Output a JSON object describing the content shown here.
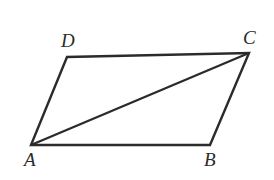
{
  "figure": {
    "kind": "geometry-diagram",
    "shape": "parallelogram-with-diagonal",
    "background_color": "#ffffff",
    "stroke_color": "#2b2b2b",
    "stroke_width": 2.4,
    "label_color": "#2b2b2b",
    "vertices": [
      {
        "name": "A",
        "label": "A",
        "x": 31,
        "y": 145
      },
      {
        "name": "B",
        "label": "B",
        "x": 210,
        "y": 145
      },
      {
        "name": "C",
        "label": "C",
        "x": 249,
        "y": 53
      },
      {
        "name": "D",
        "label": "D",
        "x": 67,
        "y": 57
      }
    ],
    "edges": [
      {
        "name": "side-AB",
        "from": "A",
        "to": "B"
      },
      {
        "name": "side-BC",
        "from": "B",
        "to": "C"
      },
      {
        "name": "side-CD",
        "from": "C",
        "to": "D"
      },
      {
        "name": "side-DA",
        "from": "D",
        "to": "A"
      },
      {
        "name": "diagonal-AC",
        "from": "A",
        "to": "C"
      }
    ],
    "labels": {
      "A": "A",
      "B": "B",
      "C": "C",
      "D": "D"
    }
  }
}
